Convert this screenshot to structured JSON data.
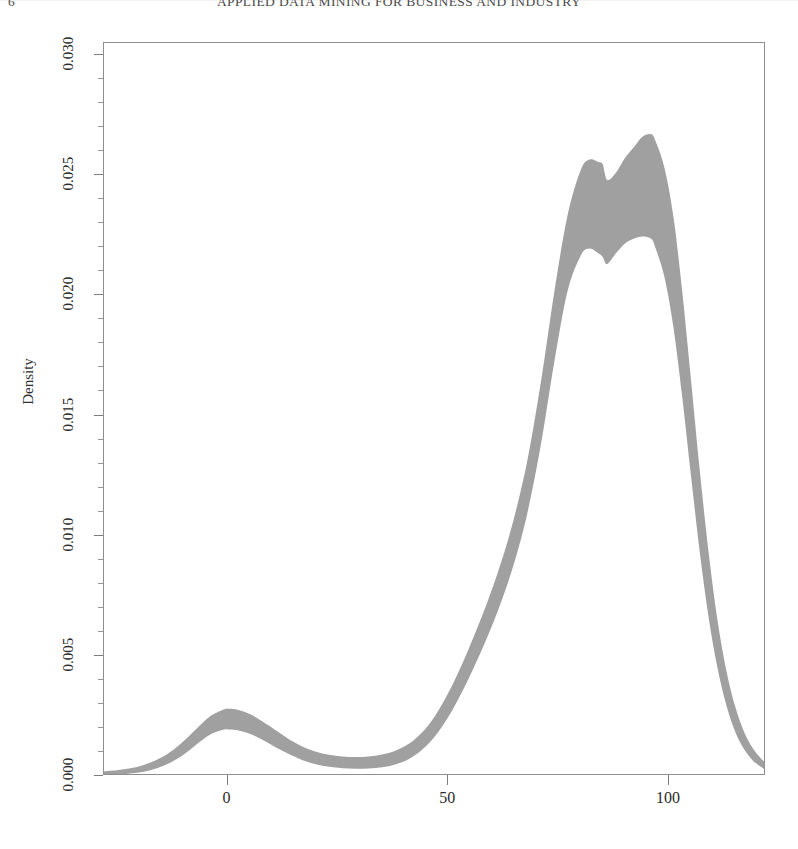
{
  "page": {
    "running_header": "APPLIED DATA MINING FOR BUSINESS AND INDUSTRY",
    "page_number": "6"
  },
  "figure": {
    "y_axis_title": "Density",
    "x_axis_title": "",
    "band_color": "#a0a0a0",
    "frame_color": "#8e8e8e",
    "background": "#ffffff"
  },
  "axes": {
    "y_ticks": [
      {
        "label": "0.000",
        "value": 0.0
      },
      {
        "label": "0.005",
        "value": 0.005
      },
      {
        "label": "0.010",
        "value": 0.01
      },
      {
        "label": "0.015",
        "value": 0.015
      },
      {
        "label": "0.020",
        "value": 0.02
      },
      {
        "label": "0.025",
        "value": 0.025
      },
      {
        "label": "0.030",
        "value": 0.03
      }
    ],
    "x_ticks": [
      {
        "label": "0",
        "value": 0
      },
      {
        "label": "50",
        "value": 50
      },
      {
        "label": "100",
        "value": 100
      }
    ]
  },
  "chart_data": {
    "type": "area",
    "title": "",
    "subtitle": "",
    "xlabel": "",
    "ylabel": "Density",
    "xlim": [
      -28,
      122
    ],
    "ylim": [
      0.0,
      0.0305
    ],
    "grid": false,
    "legend": null,
    "annotations": [],
    "series": [
      {
        "name": "upper",
        "x": [
          -28,
          -25,
          -22,
          -19,
          -16,
          -13,
          -10,
          -7,
          -4,
          -1,
          0,
          2,
          5,
          8,
          11,
          14,
          17,
          20,
          23,
          26,
          29,
          32,
          35,
          38,
          41,
          44,
          47,
          50,
          53,
          56,
          59,
          62,
          65,
          68,
          71,
          74,
          77,
          80,
          82,
          84,
          85,
          86,
          88,
          90,
          92,
          94,
          96,
          97,
          99,
          101,
          103,
          105,
          107,
          109,
          111,
          113,
          115,
          117,
          119,
          121,
          122
        ],
        "values": [
          0.0002,
          0.00024,
          0.00032,
          0.00046,
          0.00068,
          0.001,
          0.00145,
          0.00198,
          0.00248,
          0.00276,
          0.0028,
          0.00277,
          0.00258,
          0.00226,
          0.00189,
          0.00152,
          0.00122,
          0.00101,
          0.00088,
          0.00081,
          0.00079,
          0.00081,
          0.00089,
          0.00105,
          0.00133,
          0.0018,
          0.0025,
          0.00345,
          0.0046,
          0.0059,
          0.0073,
          0.0089,
          0.0108,
          0.0132,
          0.0164,
          0.0201,
          0.0233,
          0.0252,
          0.02565,
          0.02555,
          0.02545,
          0.0248,
          0.0251,
          0.0257,
          0.02615,
          0.0266,
          0.0267,
          0.0264,
          0.0253,
          0.0233,
          0.0202,
          0.0165,
          0.0127,
          0.0093,
          0.0065,
          0.0044,
          0.0029,
          0.00185,
          0.00115,
          0.0007,
          0.00055
        ]
      },
      {
        "name": "lower",
        "x": [
          -28,
          -25,
          -22,
          -19,
          -16,
          -13,
          -10,
          -7,
          -4,
          -1,
          0,
          2,
          5,
          8,
          11,
          14,
          17,
          20,
          23,
          26,
          29,
          32,
          35,
          38,
          41,
          44,
          47,
          50,
          53,
          56,
          59,
          62,
          65,
          68,
          71,
          74,
          77,
          80,
          82,
          84,
          85,
          86,
          88,
          90,
          92,
          94,
          96,
          97,
          99,
          101,
          103,
          105,
          107,
          109,
          111,
          113,
          115,
          117,
          119,
          121,
          122
        ],
        "values": [
          4e-05,
          6e-05,
          0.0001,
          0.00018,
          0.00032,
          0.00055,
          0.00088,
          0.00132,
          0.00172,
          0.00192,
          0.00194,
          0.00191,
          0.00176,
          0.0015,
          0.00119,
          0.0009,
          0.00066,
          0.00049,
          0.00038,
          0.00032,
          0.0003,
          0.00031,
          0.00036,
          0.00048,
          0.0007,
          0.00108,
          0.00165,
          0.00245,
          0.00345,
          0.0046,
          0.00585,
          0.00725,
          0.0089,
          0.011,
          0.0138,
          0.0172,
          0.02015,
          0.02165,
          0.02195,
          0.02175,
          0.0216,
          0.0213,
          0.02175,
          0.02215,
          0.02235,
          0.02245,
          0.02235,
          0.02195,
          0.02075,
          0.0187,
          0.0158,
          0.0125,
          0.0093,
          0.0066,
          0.0045,
          0.00295,
          0.00185,
          0.00112,
          0.00065,
          0.00036,
          0.00026
        ]
      }
    ]
  }
}
